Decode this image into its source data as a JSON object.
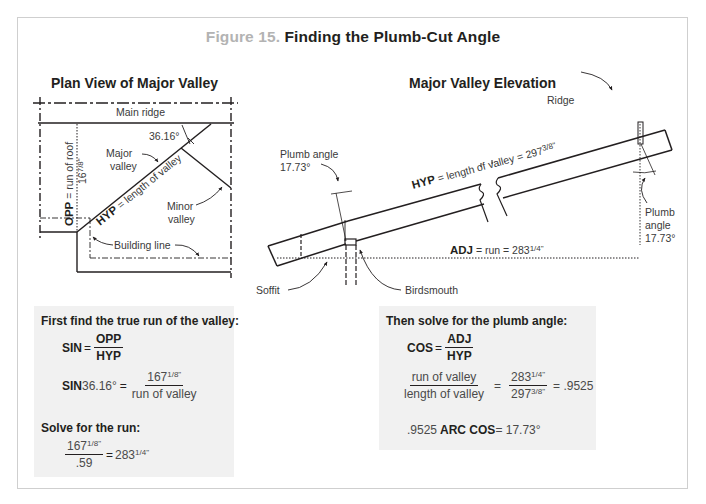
{
  "figure": {
    "number": "Figure 15.",
    "title": "Finding the Plumb-Cut Angle",
    "number_color": "#b3b3b3",
    "frame_color": "#cfcfcf",
    "box_background": "#f1f1f1"
  },
  "plan_view": {
    "title": "Plan View of Major Valley",
    "labels": {
      "main_ridge": "Main ridge",
      "angle": "36.16°",
      "major_valley_1": "Major",
      "major_valley_2": "valley",
      "opp_bold": "OPP",
      "opp_rest": " = run of roof",
      "opp_value": "167/8\"",
      "opp_value_whole": "16",
      "opp_value_frac": "7/8\"",
      "hyp_bold": "HYP",
      "hyp_rest": " = length of valley",
      "minor_valley_1": "Minor",
      "minor_valley_2": "valley",
      "building_line": "Building line"
    }
  },
  "elevation": {
    "title": "Major Valley Elevation",
    "labels": {
      "ridge": "Ridge",
      "plumb_angle_left_1": "Plumb angle",
      "plumb_angle_left_2": "17.73°",
      "hyp_bold": "HYP",
      "hyp_rest": " = length of valley = 297",
      "hyp_frac": "3/8\"",
      "plumb_right_1": "Plumb",
      "plumb_right_2": "angle",
      "plumb_right_3": "17.73°",
      "adj_bold": "ADJ",
      "adj_rest": " = run = 283",
      "adj_frac": "1/4\"",
      "soffit": "Soffit",
      "birdsmouth": "Birdsmouth"
    }
  },
  "left_box": {
    "heading": "First find the true run of the valley:",
    "eq1": {
      "lhs": "SIN",
      "eq": "=",
      "num": "OPP",
      "den": "HYP"
    },
    "eq2": {
      "lhs_bold": "SIN",
      "lhs_value": " 36.16°",
      "eq": "=",
      "num_whole": "167",
      "num_frac": "1/8\"",
      "den": "run of valley"
    },
    "heading2": "Solve for the run:",
    "eq3": {
      "num_whole": "167",
      "num_frac": "1/8\"",
      "den": ".59",
      "eq": "=",
      "result_whole": "283",
      "result_frac": "1/4\""
    }
  },
  "right_box": {
    "heading": "Then solve for the plumb angle:",
    "eq1": {
      "lhs": "COS",
      "eq": "=",
      "num": "ADJ",
      "den": "HYP"
    },
    "eq2": {
      "num_a": "run of valley",
      "den_a": "length of valley",
      "eq": "=",
      "num_b_whole": "283",
      "num_b_frac": "1/4\"",
      "den_b_whole": "297",
      "den_b_frac": "3/8\"",
      "result": "= .9525"
    },
    "eq3": {
      "value": ".9525 ",
      "func": "ARC COS",
      "result": " = 17.73°"
    }
  }
}
